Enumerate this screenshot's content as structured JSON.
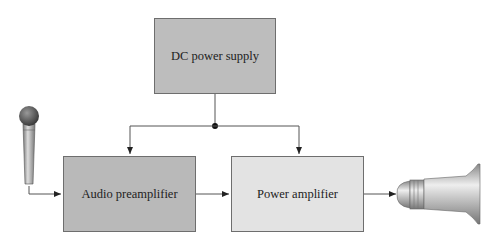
{
  "diagram": {
    "blocks": {
      "dc_power_supply": {
        "label": "DC power supply",
        "fill": "#bdbdbd"
      },
      "audio_preamplifier": {
        "label": "Audio preamplifier",
        "fill": "#b9b9b9"
      },
      "power_amplifier": {
        "label": "Power amplifier",
        "fill": "#e3e3e3"
      }
    },
    "devices": {
      "input": "microphone",
      "output": "speaker"
    },
    "connections": [
      {
        "from": "microphone",
        "to": "audio_preamplifier"
      },
      {
        "from": "audio_preamplifier",
        "to": "power_amplifier"
      },
      {
        "from": "power_amplifier",
        "to": "speaker"
      },
      {
        "from": "dc_power_supply",
        "to": "junction"
      },
      {
        "from": "junction",
        "to": "audio_preamplifier"
      },
      {
        "from": "junction",
        "to": "power_amplifier"
      }
    ]
  }
}
